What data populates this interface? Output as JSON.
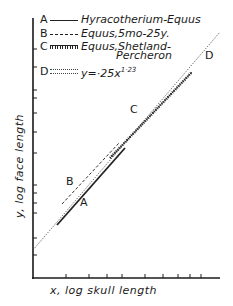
{
  "chart_data": {
    "type": "line",
    "title": "",
    "xlabel": "x, log skull length",
    "ylabel": "y, log face length",
    "scale": "log-log",
    "grid": false,
    "legend_position": "upper-left",
    "equation": "y = .25x^1.23",
    "x_ticks_px": [
      66,
      89,
      107,
      122,
      145,
      163,
      178,
      190,
      201
    ],
    "y_ticks_px": [
      49,
      67,
      90,
      98,
      113,
      132,
      153,
      185,
      193,
      203,
      213,
      238,
      255
    ],
    "series": [
      {
        "key": "A",
        "name": "Hyracotherium-Equus",
        "style": "solid",
        "points_px": [
          [
            57,
            225
          ],
          [
            125,
            148
          ]
        ]
      },
      {
        "key": "B",
        "name": "Equus, 5mo-25y.",
        "style": "dashed",
        "points_px": [
          [
            65,
            207
          ],
          [
            122,
            146
          ]
        ]
      },
      {
        "key": "C",
        "name": "Equus, Shetland-Percheron",
        "style": "crossed",
        "points_px": [
          [
            110,
            158
          ],
          [
            192,
            72
          ]
        ]
      },
      {
        "key": "D",
        "name": "y = .25x^1.23",
        "style": "dotted",
        "points_px": [
          [
            33,
            250
          ],
          [
            220,
            32
          ]
        ]
      }
    ]
  },
  "legend": {
    "items": [
      {
        "key": "A",
        "label": "Hyracotherium-Equus"
      },
      {
        "key": "B",
        "label": "Equus,5mo-25y."
      },
      {
        "key": "C",
        "label": "Equus,Shetland-",
        "label2": "Percheron"
      },
      {
        "key": "D",
        "label_base": "y=·25x",
        "label_exp": "1·23"
      }
    ]
  },
  "series_labels": {
    "A": "A",
    "B": "B",
    "C": "C",
    "D": "D"
  },
  "axes": {
    "x_label": "x, log skull length",
    "y_label": "y, log face length"
  }
}
